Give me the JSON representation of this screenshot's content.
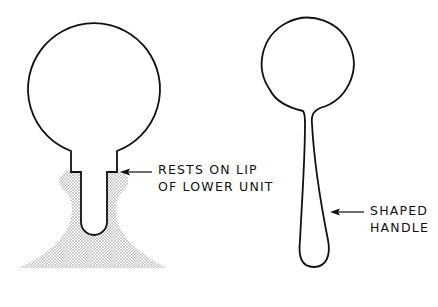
{
  "figure": {
    "left_component": {
      "name": "bulb with stepped stem resting in lower unit",
      "callout": {
        "line1": "RESTS ON LIP",
        "line2": "OF LOWER UNIT"
      }
    },
    "right_component": {
      "name": "bulb with shaped handle",
      "callout": {
        "line1": "SHAPED",
        "line2": "HANDLE"
      }
    },
    "colors": {
      "stroke": "#111111",
      "stipple": "#9a9a9a",
      "background": "#ffffff"
    }
  }
}
